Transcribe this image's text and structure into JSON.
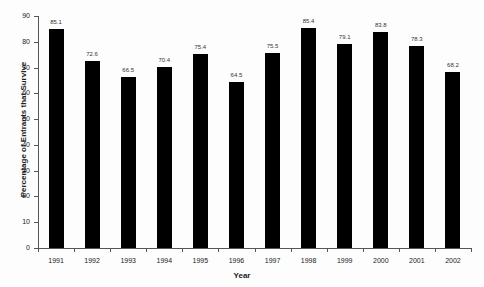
{
  "chart_data": {
    "type": "bar",
    "title": "",
    "xlabel": "Year",
    "ylabel": "Percentage of Entrants that Survive",
    "categories": [
      "1991",
      "1992",
      "1993",
      "1994",
      "1995",
      "1996",
      "1997",
      "1998",
      "1999",
      "2000",
      "2001",
      "2002"
    ],
    "values": [
      85.1,
      72.6,
      66.5,
      70.4,
      75.4,
      64.5,
      75.5,
      85.4,
      79.1,
      83.8,
      78.3,
      68.2
    ],
    "value_labels": [
      "85.1",
      "72.6",
      "66.5",
      "70.4",
      "75.4",
      "64.5",
      "75.5",
      "85.4",
      "79.1",
      "83.8",
      "78.3",
      "68.2"
    ],
    "ylim": [
      0,
      90
    ],
    "yticks": [
      "0",
      "10",
      "20",
      "30",
      "40",
      "50",
      "60",
      "70",
      "80",
      "90"
    ],
    "grid": false,
    "legend": null,
    "bar_color": "#000000"
  }
}
